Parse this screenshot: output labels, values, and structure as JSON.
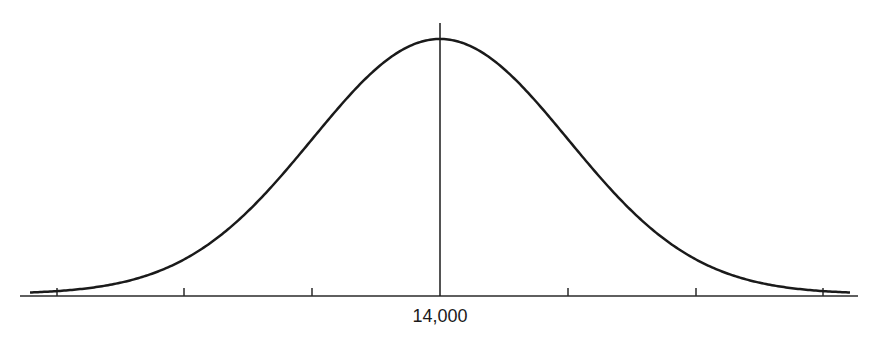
{
  "chart_data": {
    "type": "line",
    "title": "",
    "xlabel": "",
    "ylabel": "",
    "mean_label": "14,000",
    "tick_count": 7,
    "tick_labels": [
      "",
      "",
      "",
      "14,000",
      "",
      "",
      ""
    ],
    "grid": false,
    "legend": null,
    "series": [
      {
        "name": "normal-curve",
        "mean_index": 3,
        "sd_ticks": 1
      }
    ]
  },
  "diagram": {
    "center_label": "14,000",
    "line_color": "#1a1a1a"
  }
}
